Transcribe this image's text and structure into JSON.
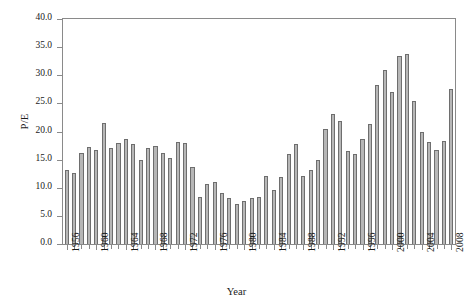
{
  "chart_data": {
    "type": "bar",
    "title": "",
    "xlabel": "Year",
    "ylabel": "P/E",
    "ylim": [
      0.0,
      40.0
    ],
    "ytick_step": 5.0,
    "ytick_labels": [
      "0.0",
      "5.0",
      "10.0",
      "15.0",
      "20.0",
      "25.0",
      "30.0",
      "35.0",
      "40.0"
    ],
    "ytick_values": [
      0.0,
      5.0,
      10.0,
      15.0,
      20.0,
      25.0,
      30.0,
      35.0,
      40.0
    ],
    "grid": false,
    "legend": "none",
    "bar_fill_color": "#b7b7b7",
    "bar_edge_color": "#6e6e6e",
    "axis_color": "#8a8a8a",
    "xtick_labels_shown": [
      "1956",
      "1960",
      "1964",
      "1968",
      "1972",
      "1976",
      "1980",
      "1984",
      "1988",
      "1992",
      "1996",
      "2000",
      "2004",
      "2008"
    ],
    "categories": [
      "1956",
      "1957",
      "1958",
      "1959",
      "1960",
      "1961",
      "1962",
      "1963",
      "1964",
      "1965",
      "1966",
      "1967",
      "1968",
      "1969",
      "1970",
      "1971",
      "1972",
      "1973",
      "1974",
      "1975",
      "1976",
      "1977",
      "1978",
      "1979",
      "1980",
      "1981",
      "1982",
      "1983",
      "1984",
      "1985",
      "1986",
      "1987",
      "1988",
      "1989",
      "1990",
      "1991",
      "1992",
      "1993",
      "1994",
      "1995",
      "1996",
      "1997",
      "1998",
      "1999",
      "2000",
      "2001",
      "2002",
      "2003",
      "2004",
      "2005",
      "2006",
      "2007",
      "2008"
    ],
    "values": [
      13.2,
      12.6,
      16.1,
      17.2,
      16.8,
      21.5,
      17.1,
      18.0,
      18.7,
      17.7,
      14.9,
      17.1,
      17.4,
      16.2,
      15.3,
      18.1,
      17.9,
      13.7,
      8.4,
      10.6,
      11.0,
      9.1,
      8.1,
      7.2,
      7.6,
      8.1,
      8.4,
      12.1,
      9.6,
      11.9,
      16.0,
      17.8,
      12.1,
      13.1,
      15.0,
      20.4,
      23.2,
      21.9,
      16.6,
      16.0,
      18.6,
      21.3,
      28.3,
      31.0,
      27.1,
      33.4,
      33.8,
      25.4,
      19.9,
      18.1,
      16.7,
      18.3,
      27.6
    ]
  }
}
